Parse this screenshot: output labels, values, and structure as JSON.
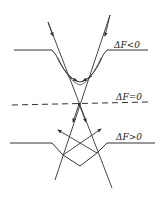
{
  "diagram": {
    "colors": {
      "line": "#333333",
      "background": "#ffffff"
    },
    "labels": {
      "negative": "ΔF<0",
      "zero": "ΔF=0",
      "positive": "ΔF>0"
    },
    "surfaces": [
      {
        "name": "surface-negative",
        "label_key": "negative",
        "type": "curved-concave",
        "level_y": 50,
        "left_x": [
          14,
          52
        ],
        "right_x": [
          107,
          148
        ],
        "bottom_y": 82
      },
      {
        "name": "focal-plane",
        "label_key": "zero",
        "type": "dashed",
        "from": [
          12,
          105
        ],
        "to": [
          148,
          102
        ]
      },
      {
        "name": "surface-positive",
        "label_key": "positive",
        "type": "v-notch",
        "level_y": 143,
        "left_x": [
          10,
          52
        ],
        "right_x": [
          107,
          155
        ],
        "apex": [
          80,
          166
        ]
      }
    ],
    "rays": [
      {
        "name": "ray-left",
        "from": [
          48,
          22
        ],
        "focus": [
          79,
          104
        ],
        "to": [
          112,
          188
        ]
      },
      {
        "name": "ray-right",
        "from": [
          110,
          15
        ],
        "focus": [
          79,
          104
        ],
        "to": [
          55,
          180
        ]
      }
    ],
    "focus_point": [
      79,
      104
    ]
  }
}
